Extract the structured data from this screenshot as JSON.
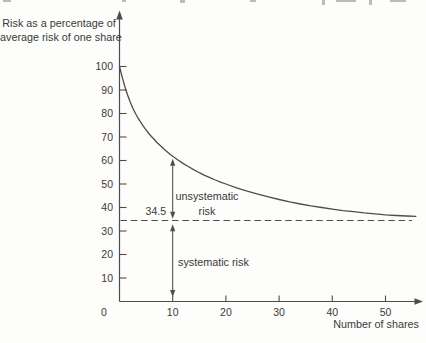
{
  "figure": {
    "background": "#fdfdfb",
    "ink": "#3a3a3a",
    "line_color": "#4d4d4d"
  },
  "chart_data": {
    "type": "line",
    "ylabel_lines": [
      "Risk as a percentage of",
      "average risk of one share"
    ],
    "xlabel": "Number of shares",
    "x_ticks": [
      0,
      10,
      20,
      30,
      40,
      50
    ],
    "y_ticks": [
      100,
      90,
      80,
      70,
      60,
      50,
      40,
      30,
      20,
      10
    ],
    "xlim": [
      0,
      57
    ],
    "ylim": [
      0,
      121
    ],
    "grid": false,
    "asymptote": {
      "value": 34.5,
      "label": "34.5",
      "style": "dashed"
    },
    "annotations": [
      {
        "id": "unsystematic-risk",
        "lines": [
          "unsystematic",
          "risk"
        ],
        "arrow": {
          "x": 10,
          "from": "curve",
          "to": "asymptote",
          "double_headed": true
        }
      },
      {
        "id": "systematic-risk",
        "lines": [
          "systematic risk"
        ],
        "arrow": {
          "x": 10,
          "from": "asymptote",
          "to": 0,
          "double_headed": true
        }
      }
    ],
    "series": [
      {
        "points": [
          [
            0,
            100
          ],
          [
            0.5,
            95.5
          ],
          [
            1,
            91.5
          ],
          [
            1.5,
            88
          ],
          [
            2,
            85
          ],
          [
            2.5,
            82.3
          ],
          [
            3,
            80
          ],
          [
            3.5,
            78
          ],
          [
            4,
            76.2
          ],
          [
            4.5,
            74.5
          ],
          [
            5,
            73
          ],
          [
            5.5,
            71.5
          ],
          [
            6,
            70.2
          ],
          [
            6.5,
            69
          ],
          [
            7,
            67.8
          ],
          [
            7.5,
            66.7
          ],
          [
            8,
            65.6
          ],
          [
            8.5,
            64.6
          ],
          [
            9,
            63.6
          ],
          [
            9.5,
            62.7
          ],
          [
            10,
            61.8
          ],
          [
            11,
            60.2
          ],
          [
            12,
            58.7
          ],
          [
            13,
            57.3
          ],
          [
            14,
            56
          ],
          [
            15,
            54.8
          ],
          [
            16,
            53.7
          ],
          [
            17,
            52.7
          ],
          [
            18,
            51.7
          ],
          [
            19,
            50.8
          ],
          [
            20,
            50
          ],
          [
            22,
            48.4
          ],
          [
            24,
            47
          ],
          [
            26,
            45.7
          ],
          [
            28,
            44.5
          ],
          [
            30,
            43.4
          ],
          [
            32,
            42.4
          ],
          [
            34,
            41.5
          ],
          [
            36,
            40.7
          ],
          [
            38,
            40
          ],
          [
            40,
            39.3
          ],
          [
            42,
            38.7
          ],
          [
            44,
            38.2
          ],
          [
            46,
            37.7
          ],
          [
            48,
            37.3
          ],
          [
            50,
            36.9
          ],
          [
            52,
            36.6
          ],
          [
            54,
            36.4
          ],
          [
            55.7,
            36.2
          ]
        ]
      }
    ]
  }
}
